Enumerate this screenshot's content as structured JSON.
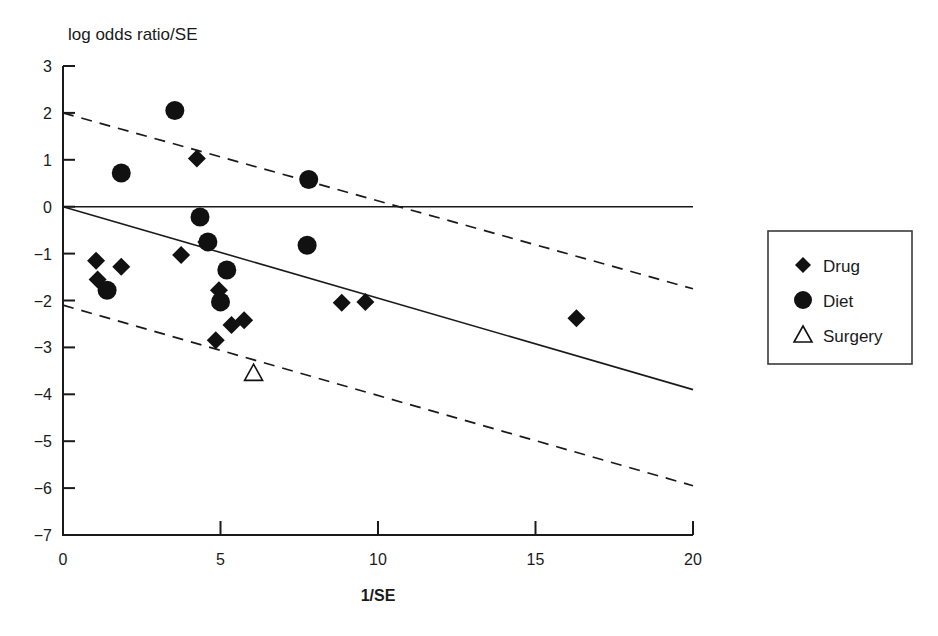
{
  "chart_data": {
    "type": "scatter",
    "title": "",
    "ylabel": "log odds ratio/SE",
    "xlabel": "1/SE",
    "xlim": [
      0,
      20
    ],
    "ylim": [
      -7,
      3
    ],
    "xticks": [
      0,
      5,
      10,
      15,
      20
    ],
    "yticks": [
      3,
      2,
      1,
      0,
      -1,
      -2,
      -3,
      -4,
      -5,
      -6,
      -7
    ],
    "xtick_labels": [
      "0",
      "5",
      "10",
      "15",
      "20"
    ],
    "ytick_labels": [
      "3",
      "2",
      "1",
      "0",
      "−1",
      "−2",
      "−3",
      "−4",
      "−5",
      "−6",
      "−7"
    ],
    "grid": false,
    "legend_position": "right-outside",
    "legend": [
      {
        "label": "Drug",
        "marker": "filled-diamond"
      },
      {
        "label": "Diet",
        "marker": "filled-circle"
      },
      {
        "label": "Surgery",
        "marker": "open-triangle"
      }
    ],
    "series": [
      {
        "name": "Drug",
        "marker": "filled-diamond",
        "color": "#111111",
        "points": [
          {
            "x": 1.05,
            "y": -1.15
          },
          {
            "x": 1.1,
            "y": -1.55
          },
          {
            "x": 1.85,
            "y": -1.28
          },
          {
            "x": 4.25,
            "y": 1.03
          },
          {
            "x": 3.75,
            "y": -1.03
          },
          {
            "x": 4.55,
            "y": -0.75
          },
          {
            "x": 4.95,
            "y": -1.78
          },
          {
            "x": 4.85,
            "y": -2.85
          },
          {
            "x": 5.35,
            "y": -2.52
          },
          {
            "x": 5.75,
            "y": -2.42
          },
          {
            "x": 8.85,
            "y": -2.05
          },
          {
            "x": 9.6,
            "y": -2.03
          },
          {
            "x": 16.3,
            "y": -2.38
          }
        ]
      },
      {
        "name": "Diet",
        "marker": "filled-circle",
        "color": "#111111",
        "points": [
          {
            "x": 3.55,
            "y": 2.05
          },
          {
            "x": 1.85,
            "y": 0.72
          },
          {
            "x": 4.35,
            "y": -0.22
          },
          {
            "x": 4.6,
            "y": -0.75
          },
          {
            "x": 5.2,
            "y": -1.35
          },
          {
            "x": 5.0,
            "y": -2.03
          },
          {
            "x": 1.4,
            "y": -1.78
          },
          {
            "x": 7.8,
            "y": 0.58
          },
          {
            "x": 7.75,
            "y": -0.82
          }
        ]
      },
      {
        "name": "Surgery",
        "marker": "open-triangle",
        "color": "#111111",
        "points": [
          {
            "x": 6.05,
            "y": -3.55
          }
        ]
      }
    ],
    "reference_lines": [
      {
        "name": "null-effect-line",
        "style": "solid",
        "x": [
          0,
          20
        ],
        "y": [
          0,
          0
        ]
      },
      {
        "name": "regression-fit-line",
        "style": "solid",
        "x": [
          0,
          20
        ],
        "y": [
          0,
          -3.9
        ]
      },
      {
        "name": "upper-confidence-bound",
        "style": "dashed",
        "x": [
          0,
          20
        ],
        "y": [
          2.0,
          -1.75
        ]
      },
      {
        "name": "lower-confidence-bound",
        "style": "dashed",
        "x": [
          0,
          20
        ],
        "y": [
          -2.1,
          -5.95
        ]
      }
    ]
  }
}
